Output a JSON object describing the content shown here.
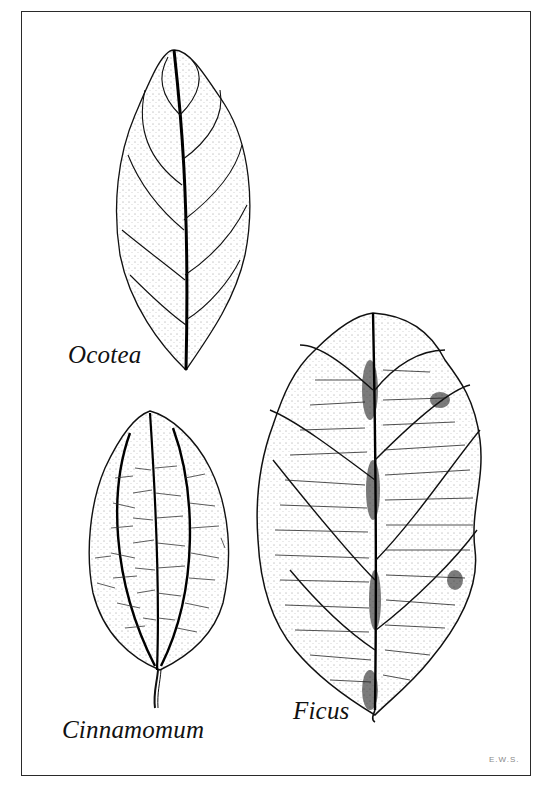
{
  "figure": {
    "type": "botanical line illustration",
    "frame": {
      "stroke_color": "#2a2a2a",
      "background": "#ffffff"
    },
    "leaves": [
      {
        "id": "ocotea",
        "label": "Ocotea",
        "venation": "pinnate, camptodromous"
      },
      {
        "id": "cinnamomum",
        "label": "Cinnamomum",
        "venation": "acrodromous (three main veins)"
      },
      {
        "id": "ficus",
        "label": "Ficus",
        "venation": "pinnate, brochidodromous"
      }
    ],
    "signature": "E.W.S."
  }
}
